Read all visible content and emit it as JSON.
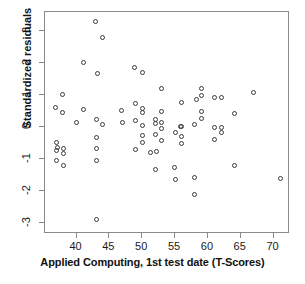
{
  "chart_data": {
    "type": "scatter",
    "title": "",
    "xlabel": "Applied Computing, 1st test date (T-Scores)",
    "ylabel": "Standardized residuals",
    "xlim": [
      35.2,
      72.5
    ],
    "ylim": [
      -3.35,
      3.6
    ],
    "xticks": [
      40,
      45,
      50,
      55,
      60,
      65,
      70
    ],
    "yticks": [
      3,
      2,
      1,
      0,
      -1,
      -2,
      -3
    ],
    "xtick_labels": [
      "40",
      "45",
      "50",
      "55",
      "60",
      "65",
      "70"
    ],
    "ytick_labels": [
      "3",
      "2",
      "1",
      "0",
      "-1",
      "-2",
      "-3"
    ],
    "grid": false,
    "legend": "none",
    "marker": "open-circle",
    "marker_color": "#3a3a3a",
    "n_points": 69,
    "points": [
      [
        42.9,
        3.3
      ],
      [
        44.0,
        2.8
      ],
      [
        41.0,
        2.01
      ],
      [
        43.2,
        1.69
      ],
      [
        48.8,
        1.86
      ],
      [
        50.0,
        1.7
      ],
      [
        53.0,
        1.22
      ],
      [
        59.0,
        1.2
      ],
      [
        67.0,
        1.07
      ],
      [
        37.9,
        1.01
      ],
      [
        59.1,
        0.99
      ],
      [
        61.0,
        0.92
      ],
      [
        62.0,
        0.93
      ],
      [
        58.2,
        0.85
      ],
      [
        56.0,
        0.77
      ],
      [
        49.0,
        0.75
      ],
      [
        36.8,
        0.61
      ],
      [
        41.0,
        0.54
      ],
      [
        50.1,
        0.59
      ],
      [
        46.9,
        0.51
      ],
      [
        53.0,
        0.5
      ],
      [
        37.9,
        0.46
      ],
      [
        50.1,
        0.45
      ],
      [
        59.1,
        0.49
      ],
      [
        64.0,
        0.43
      ],
      [
        59.1,
        0.27
      ],
      [
        43.0,
        0.22
      ],
      [
        49.0,
        0.21
      ],
      [
        40.0,
        0.14
      ],
      [
        53.0,
        0.15
      ],
      [
        47.0,
        0.15
      ],
      [
        52.0,
        0.25
      ],
      [
        44.0,
        0.07
      ],
      [
        50.1,
        0.06
      ],
      [
        52.0,
        0.11
      ],
      [
        58.0,
        0.09
      ],
      [
        56.0,
        0.03
      ],
      [
        55.9,
        0.02
      ],
      [
        61.0,
        -0.01
      ],
      [
        62.1,
        -0.01
      ],
      [
        53.0,
        -0.05
      ],
      [
        55.0,
        -0.16
      ],
      [
        62.0,
        -0.17
      ],
      [
        50.0,
        -0.28
      ],
      [
        43.0,
        -0.32
      ],
      [
        56.0,
        -0.3
      ],
      [
        52.0,
        -0.25
      ],
      [
        61.0,
        -0.39
      ],
      [
        53.0,
        -0.41
      ],
      [
        36.9,
        -0.5
      ],
      [
        50.0,
        -0.49
      ],
      [
        56.0,
        -0.52
      ],
      [
        37.1,
        -0.64
      ],
      [
        38.0,
        -0.66
      ],
      [
        43.0,
        -0.68
      ],
      [
        49.0,
        -0.7
      ],
      [
        37.0,
        -0.73
      ],
      [
        51.2,
        -0.79
      ],
      [
        52.2,
        -0.77
      ],
      [
        38.0,
        -0.83
      ],
      [
        36.9,
        -1.04
      ],
      [
        43.0,
        -1.05
      ],
      [
        38.0,
        -1.19
      ],
      [
        64.0,
        -1.22
      ],
      [
        54.9,
        -1.27
      ],
      [
        52.0,
        -1.33
      ],
      [
        55.0,
        -1.65
      ],
      [
        58.0,
        -1.58
      ],
      [
        71.0,
        -1.62
      ],
      [
        58.0,
        -2.1
      ],
      [
        43.0,
        -2.89
      ]
    ]
  }
}
